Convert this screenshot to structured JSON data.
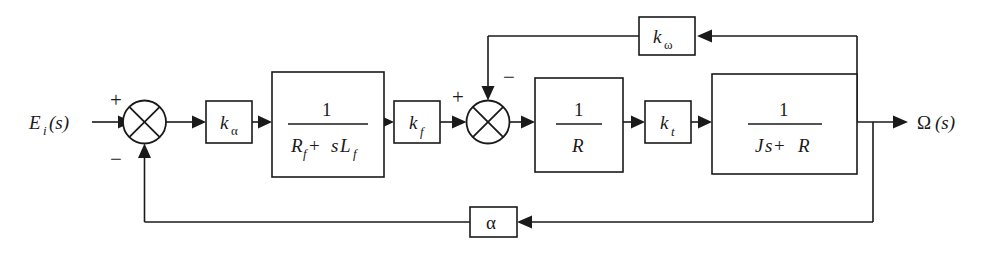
{
  "diagram": {
    "type": "control-system-block-diagram",
    "background_color": "#ffffff",
    "line_color": "#1a1a1a",
    "input": {
      "label_main": "E",
      "label_sub": "i",
      "label_arg": "(s)"
    },
    "output": {
      "label_main": "Ω",
      "label_arg": "(s)"
    },
    "summing_junctions": [
      {
        "name": "outer-summing-junction",
        "sign_input": "+",
        "sign_feedback": "−",
        "cx": 144.5,
        "cy": 122,
        "r": 21.5
      },
      {
        "name": "inner-summing-junction",
        "sign_input": "+",
        "sign_feedback": "−",
        "cx": 488,
        "cy": 122,
        "r": 21.5
      }
    ],
    "blocks": [
      {
        "name": "gain-k-alpha",
        "kind": "gain",
        "symbol": "k",
        "subscript": "α",
        "subscript_style": "upright",
        "x": 206,
        "y": 101,
        "w": 46,
        "h": 42
      },
      {
        "name": "field-transfer-function",
        "kind": "fraction",
        "numerator": "1",
        "denominator_parts": [
          {
            "text": "R",
            "style": "italic"
          },
          {
            "text": "f",
            "style": "sub"
          },
          {
            "text": " + ",
            "style": "upright"
          },
          {
            "text": "s",
            "style": "italic"
          },
          {
            "text": "L",
            "style": "italic"
          },
          {
            "text": "f",
            "style": "sub"
          }
        ],
        "denominator_text": "R_f + sL_f",
        "x": 272,
        "y": 72,
        "w": 112,
        "h": 105
      },
      {
        "name": "gain-k-f",
        "kind": "gain",
        "symbol": "k",
        "subscript": "f",
        "subscript_style": "italic",
        "x": 394,
        "y": 101,
        "w": 46,
        "h": 42
      },
      {
        "name": "armature-resistance-block",
        "kind": "fraction",
        "numerator": "1",
        "denominator_parts": [
          {
            "text": "R",
            "style": "italic"
          }
        ],
        "denominator_text": "R",
        "x": 535,
        "y": 78,
        "w": 88,
        "h": 94
      },
      {
        "name": "gain-k-t",
        "kind": "gain",
        "symbol": "k",
        "subscript": "t",
        "subscript_style": "italic",
        "x": 645,
        "y": 101,
        "w": 46,
        "h": 42
      },
      {
        "name": "mechanical-transfer-function",
        "kind": "fraction",
        "numerator": "1",
        "denominator_parts": [
          {
            "text": "J",
            "style": "italic"
          },
          {
            "text": "s",
            "style": "italic"
          },
          {
            "text": " + ",
            "style": "upright"
          },
          {
            "text": "R",
            "style": "italic"
          }
        ],
        "denominator_text": "Js + R",
        "x": 712,
        "y": 74,
        "w": 145,
        "h": 100
      },
      {
        "name": "feedback-gain-k-omega",
        "kind": "gain",
        "symbol": "k",
        "subscript": "ω",
        "subscript_style": "upright",
        "x": 639,
        "y": 17,
        "w": 56,
        "h": 38
      },
      {
        "name": "feedback-gain-alpha",
        "kind": "symbol",
        "symbol": "α",
        "symbol_style": "upright",
        "x": 470,
        "y": 207,
        "w": 47,
        "h": 30
      }
    ],
    "signs": {
      "outer_plus": "+",
      "outer_minus": "−",
      "inner_plus": "+",
      "inner_minus": "−"
    },
    "feedback_paths": [
      {
        "name": "inner-velocity-feedback-path",
        "tap_x": 857,
        "tap_y": 36,
        "block": "k_omega",
        "target": "inner-summing-junction"
      },
      {
        "name": "outer-position-feedback-path",
        "tap_x": 873,
        "tap_y": 222,
        "block": "alpha",
        "target": "outer-summing-junction"
      }
    ]
  }
}
